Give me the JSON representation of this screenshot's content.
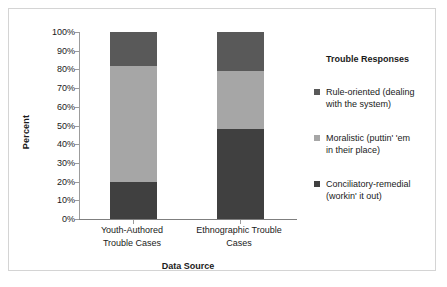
{
  "chart_data": {
    "type": "bar",
    "subtype": "100% stacked column",
    "title": "",
    "xlabel": "Data Source",
    "ylabel": "Percent",
    "ylim": [
      0,
      100
    ],
    "grid": false,
    "legend_position": "right",
    "legend_title": "Trouble Responses",
    "categories": [
      "Youth-Authored Trouble Cases",
      "Ethnographic Trouble Cases"
    ],
    "category_lines": [
      [
        "Youth-Authored",
        "Trouble Cases"
      ],
      [
        "Ethnographic Trouble",
        "Cases"
      ]
    ],
    "y_ticks": [
      "0%",
      "10%",
      "20%",
      "30%",
      "40%",
      "50%",
      "60%",
      "70%",
      "80%",
      "90%",
      "100%"
    ],
    "y_tick_values": [
      0,
      10,
      20,
      30,
      40,
      50,
      60,
      70,
      80,
      90,
      100
    ],
    "series": [
      {
        "name": "Rule-oriented (dealing with the system)",
        "name_lines": [
          "Rule-oriented (dealing",
          "with the system)"
        ],
        "color": "#595959",
        "values": [
          18,
          21
        ]
      },
      {
        "name": "Moralistic (puttin' 'em in their place)",
        "name_lines": [
          "Moralistic (puttin' 'em",
          "in their place)"
        ],
        "color": "#a6a6a6",
        "values": [
          62,
          31
        ]
      },
      {
        "name": "Conciliatory-remedial (workin' it out)",
        "name_lines": [
          "Conciliatory-remedial",
          "(workin' it out)"
        ],
        "color": "#404040",
        "values": [
          20,
          48
        ]
      }
    ],
    "stack_order_bottom_to_top": [
      "Conciliatory-remedial (workin' it out)",
      "Moralistic (puttin' 'em in their place)",
      "Rule-oriented (dealing with the system)"
    ]
  },
  "frame": {
    "border_color": "#d4d4d4",
    "background": "#ffffff"
  }
}
